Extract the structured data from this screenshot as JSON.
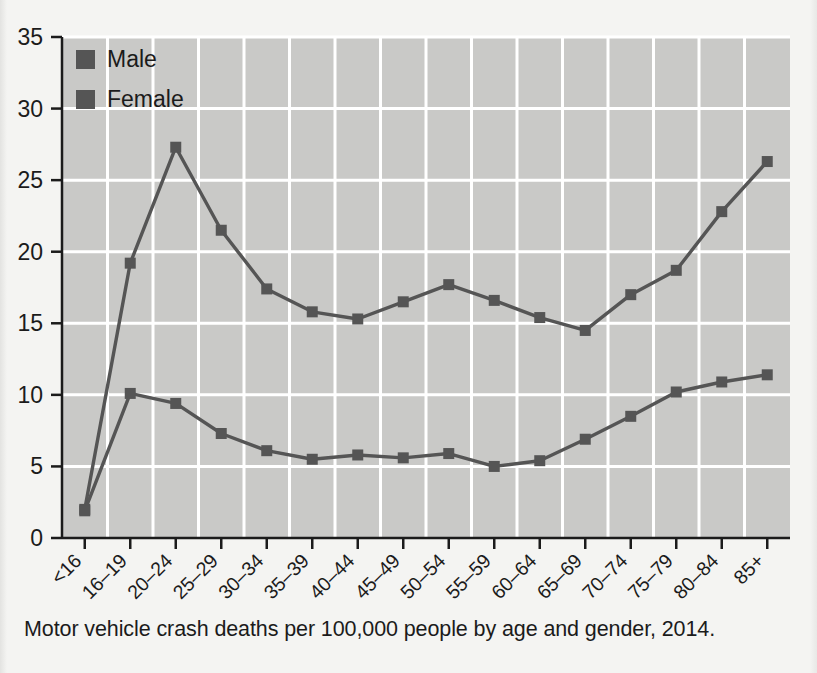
{
  "caption": "Motor vehicle crash deaths per 100,000 people by age and gender, 2014.",
  "colors": {
    "page_background": "#f4f4f2",
    "plot_background": "#c9c9c7",
    "gridline": "#ffffff",
    "series_male": "#555555",
    "series_female": "#555555",
    "axis": "#1b1b1b",
    "text": "#1b1b1b"
  },
  "legend": {
    "position": "top-left-inside",
    "entries": [
      {
        "label": "Male",
        "marker": "square",
        "color": "#555555"
      },
      {
        "label": "Female",
        "marker": "square",
        "color": "#555555"
      }
    ]
  },
  "axes": {
    "y": {
      "min": 0,
      "max": 35,
      "step": 5,
      "ticks": [
        "0",
        "5",
        "10",
        "15",
        "20",
        "25",
        "30",
        "35"
      ]
    },
    "x": {
      "label_rotation_deg": -45,
      "ticks": [
        "<16",
        "16–19",
        "20–24",
        "25–29",
        "30–34",
        "35–39",
        "40–44",
        "45–49",
        "50–54",
        "55–59",
        "60–64",
        "65–69",
        "70–74",
        "75–79",
        "80–84",
        "85+"
      ]
    }
  },
  "chart_data": {
    "type": "line",
    "title": "",
    "xlabel": "",
    "ylabel": "",
    "ylim": [
      0,
      35
    ],
    "grid": true,
    "legend_position": "top-left-inside",
    "categories": [
      "<16",
      "16–19",
      "20–24",
      "25–29",
      "30–34",
      "35–39",
      "40–44",
      "45–49",
      "50–54",
      "55–59",
      "60–64",
      "65–69",
      "70–74",
      "75–79",
      "80–84",
      "85+"
    ],
    "series": [
      {
        "name": "Male",
        "color": "#555555",
        "marker": "square",
        "values": [
          2.0,
          19.2,
          27.3,
          21.5,
          17.4,
          15.8,
          15.3,
          16.5,
          17.7,
          16.6,
          15.4,
          14.5,
          17.0,
          18.7,
          22.8,
          26.3
        ]
      },
      {
        "name": "Female",
        "color": "#555555",
        "marker": "square",
        "values": [
          1.9,
          10.1,
          9.4,
          7.3,
          6.1,
          5.5,
          5.8,
          5.6,
          5.9,
          5.0,
          5.4,
          6.9,
          8.5,
          10.2,
          10.9,
          11.4
        ]
      }
    ]
  }
}
